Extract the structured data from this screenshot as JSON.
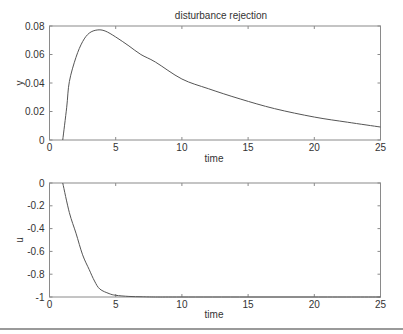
{
  "chart_data": [
    {
      "type": "line",
      "title": "disturbance rejection",
      "xlabel": "time",
      "ylabel": "y",
      "xlim": [
        0,
        25
      ],
      "ylim": [
        0,
        0.08
      ],
      "grid": false,
      "xticks": [
        0,
        5,
        10,
        15,
        20,
        25
      ],
      "xtick_labels": [
        "0",
        "5",
        "10",
        "15",
        "20",
        "25"
      ],
      "yticks": [
        0,
        0.02,
        0.04,
        0.06,
        0.08
      ],
      "ytick_labels": [
        "0",
        "0.02",
        "0.04",
        "0.06",
        "0.08"
      ],
      "series": [
        {
          "name": "y",
          "x": [
            1,
            1.3,
            1.5,
            2,
            2.5,
            3,
            3.6,
            4.2,
            5,
            6,
            6.9,
            8,
            10,
            12,
            14.4,
            17,
            20,
            22.5,
            25
          ],
          "y": [
            0,
            0.023,
            0.041,
            0.058,
            0.069,
            0.075,
            0.0772,
            0.0765,
            0.0723,
            0.066,
            0.06,
            0.0547,
            0.0428,
            0.036,
            0.0288,
            0.022,
            0.0161,
            0.0125,
            0.0091
          ]
        }
      ]
    },
    {
      "type": "line",
      "title": "",
      "xlabel": "time",
      "ylabel": "u",
      "xlim": [
        0,
        25
      ],
      "ylim": [
        -1,
        0
      ],
      "grid": false,
      "xticks": [
        0,
        5,
        10,
        15,
        20,
        25
      ],
      "xtick_labels": [
        "0",
        "5",
        "10",
        "15",
        "20",
        "25"
      ],
      "yticks": [
        0,
        -0.2,
        -0.4,
        -0.6,
        -0.8,
        -1
      ],
      "ytick_labels": [
        "0",
        "-0.2",
        "-0.4",
        "-0.6",
        "-0.8",
        "-1"
      ],
      "series": [
        {
          "name": "u",
          "x": [
            1,
            1.5,
            2,
            2.5,
            3,
            3.4,
            3.8,
            4.5,
            5,
            6,
            7,
            8,
            10,
            15,
            20,
            25
          ],
          "y": [
            0,
            -0.26,
            -0.44,
            -0.63,
            -0.76,
            -0.86,
            -0.93,
            -0.97,
            -0.985,
            -0.995,
            -0.998,
            -1,
            -1,
            -1,
            -1,
            -1
          ]
        }
      ]
    }
  ],
  "layout": {
    "panels": [
      {
        "left": 49.5,
        "top": 26,
        "right": 380.5,
        "bottom": 140
      },
      {
        "left": 49.5,
        "top": 183,
        "right": 380.5,
        "bottom": 297
      }
    ],
    "colors": {
      "frame": "#8a8a8a",
      "curve": "#555555",
      "text": "#333333"
    }
  }
}
